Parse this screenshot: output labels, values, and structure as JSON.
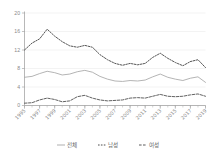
{
  "chart_data": {
    "type": "line",
    "title": "",
    "subtitle": "",
    "xlabel": "",
    "ylabel": "",
    "ylim": [
      0,
      20
    ],
    "yticks": [
      0,
      4,
      8,
      12,
      16,
      20
    ],
    "grid": true,
    "legend_position": "bottom",
    "x": [
      1995,
      1996,
      1997,
      1998,
      1999,
      2000,
      2001,
      2002,
      2003,
      2004,
      2005,
      2006,
      2007,
      2008,
      2009,
      2010,
      2011,
      2012,
      2013,
      2014,
      2015,
      2016,
      2017,
      2018,
      2019
    ],
    "xtick_labels": [
      "1995",
      "1997",
      "1999",
      "2001",
      "2003",
      "2005",
      "2007",
      "2009",
      "2011",
      "2013",
      "2015",
      "2017",
      "2019"
    ],
    "xtick_values": [
      1995,
      1997,
      1999,
      2001,
      2003,
      2005,
      2007,
      2009,
      2011,
      2013,
      2015,
      2017,
      2019
    ],
    "series": [
      {
        "name": "전체",
        "style": "solid",
        "color": "#a6a6a6",
        "values": [
          6.1,
          6.3,
          6.9,
          7.4,
          7.1,
          6.6,
          6.8,
          7.3,
          7.6,
          7.2,
          6.3,
          5.7,
          5.3,
          5.2,
          5.4,
          5.3,
          5.5,
          6.2,
          6.8,
          6.1,
          5.7,
          5.4,
          5.9,
          6.2,
          5.0
        ]
      },
      {
        "name": "남성",
        "style": "dotted",
        "color": "#4d4d4d",
        "values": [
          12.0,
          13.5,
          14.4,
          16.5,
          15.0,
          13.8,
          12.9,
          12.6,
          13.0,
          12.6,
          11.0,
          9.9,
          9.1,
          8.7,
          9.1,
          8.8,
          9.1,
          10.4,
          11.3,
          10.2,
          9.3,
          8.6,
          9.5,
          9.9,
          8.2
        ]
      },
      {
        "name": "여성",
        "style": "dashed",
        "color": "#5a5a5a",
        "values": [
          0.5,
          0.6,
          1.2,
          1.6,
          1.3,
          0.8,
          1.0,
          1.9,
          2.2,
          1.6,
          1.2,
          1.0,
          1.1,
          1.2,
          1.6,
          1.7,
          1.6,
          2.0,
          2.4,
          2.0,
          1.9,
          2.0,
          2.3,
          2.5,
          2.0
        ]
      }
    ]
  },
  "legend": {
    "items": [
      {
        "label": "전체",
        "style": "solid"
      },
      {
        "label": "남성",
        "style": "dotted"
      },
      {
        "label": "여성",
        "style": "dashed"
      }
    ]
  }
}
